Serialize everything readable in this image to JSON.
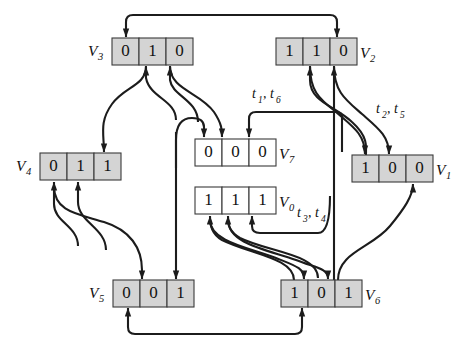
{
  "figure": {
    "type": "state-transition-diagram",
    "background_color": "#ffffff",
    "shaded_cell_color": "#d4d4d4",
    "plain_cell_color": "#ffffff",
    "edge_color": "#1c1c1c"
  },
  "nodes": [
    {
      "id": "v3",
      "label": "V",
      "subscript": "3",
      "bits": [
        "0",
        "1",
        "0"
      ],
      "shaded": true,
      "label_side": "left",
      "box": {
        "x": 112,
        "y": 38,
        "w": 81,
        "h": 27
      }
    },
    {
      "id": "v2",
      "label": "V",
      "subscript": "2",
      "bits": [
        "1",
        "1",
        "0"
      ],
      "shaded": true,
      "label_side": "right",
      "box": {
        "x": 276,
        "y": 38,
        "w": 81,
        "h": 27
      }
    },
    {
      "id": "v7",
      "label": "V",
      "subscript": "7",
      "bits": [
        "0",
        "0",
        "0"
      ],
      "shaded": false,
      "label_side": "right",
      "box": {
        "x": 195,
        "y": 139,
        "w": 81,
        "h": 27
      }
    },
    {
      "id": "v4",
      "label": "V",
      "subscript": "4",
      "bits": [
        "0",
        "1",
        "1"
      ],
      "shaded": true,
      "label_side": "left",
      "box": {
        "x": 40,
        "y": 153,
        "w": 81,
        "h": 27
      }
    },
    {
      "id": "v1",
      "label": "V",
      "subscript": "1",
      "bits": [
        "1",
        "0",
        "0"
      ],
      "shaded": true,
      "label_side": "right",
      "box": {
        "x": 352,
        "y": 155,
        "w": 81,
        "h": 27
      }
    },
    {
      "id": "v0",
      "label": "V",
      "subscript": "0",
      "bits": [
        "1",
        "1",
        "1"
      ],
      "shaded": false,
      "label_side": "right",
      "box": {
        "x": 195,
        "y": 187,
        "w": 81,
        "h": 27
      }
    },
    {
      "id": "v5",
      "label": "V",
      "subscript": "5",
      "bits": [
        "0",
        "0",
        "1"
      ],
      "shaded": true,
      "label_side": "left",
      "box": {
        "x": 113,
        "y": 280,
        "w": 81,
        "h": 27
      }
    },
    {
      "id": "v6",
      "label": "V",
      "subscript": "6",
      "bits": [
        "1",
        "0",
        "1"
      ],
      "shaded": true,
      "label_side": "right",
      "box": {
        "x": 281,
        "y": 280,
        "w": 81,
        "h": 27
      }
    }
  ],
  "transition_labels": [
    {
      "id": "t16",
      "parts": [
        {
          "base": "t",
          "sub": "1"
        },
        {
          "base": "t",
          "sub": "6"
        }
      ],
      "text": "t1, t6",
      "x": 252,
      "y": 95
    },
    {
      "id": "t25",
      "parts": [
        {
          "base": "t",
          "sub": "2"
        },
        {
          "base": "t",
          "sub": "5"
        }
      ],
      "text": "t2, t5",
      "x": 376,
      "y": 110
    },
    {
      "id": "t34",
      "parts": [
        {
          "base": "t",
          "sub": "3"
        },
        {
          "base": "t",
          "sub": "4"
        }
      ],
      "text": "t3, t4",
      "x": 297,
      "y": 214
    }
  ],
  "edges": [
    {
      "id": "e-top-loop",
      "from": "v2",
      "to": "v3",
      "note": "top horizontal loop with two downward arrowheads"
    },
    {
      "id": "e-bottom-loop",
      "from": "v5",
      "to": "v6",
      "note": "bottom horizontal loop with two upward arrowheads"
    },
    {
      "id": "e-v3b2-v4",
      "from": "v3",
      "to": "v4",
      "note": "crossing curve into v4 bit 3"
    },
    {
      "id": "e-v3b3-v7",
      "from": "v3",
      "to": "v7",
      "note": "crossing curve into v7 bit 2"
    },
    {
      "id": "e-v7b1-up",
      "from": "v5",
      "to": "v7",
      "note": "curve up into v7 bit 1"
    },
    {
      "id": "e-v7b3-t16",
      "from": "v1",
      "to": "v7",
      "note": "labeled t1,t6 long horizontal edge into v7 bit 3"
    },
    {
      "id": "e-v2b2",
      "from": "v1",
      "to": "v2",
      "note": "crossing curve into v2 bit 2"
    },
    {
      "id": "e-v2b3",
      "from": "v6",
      "to": "v2",
      "note": "straight vertical edge into v2 bit 3"
    },
    {
      "id": "e-v1b1",
      "from": "v2",
      "to": "v1",
      "note": "crossing curve into v1 bit 1"
    },
    {
      "id": "e-v1b2",
      "from": "v2",
      "to": "v1",
      "note": "crossing curve into v1 bit 2"
    },
    {
      "id": "e-v1b3",
      "from": "v6",
      "to": "v1",
      "note": "curve up from v6 into v1 bit 3"
    },
    {
      "id": "e-v4b1",
      "from": "v5",
      "to": "v4",
      "note": "curve up into v4 bit 1"
    },
    {
      "id": "e-v4b2",
      "from": "v5",
      "to": "v4",
      "note": "curve up into v4 bit 2"
    },
    {
      "id": "e-v5b2",
      "from": "v4",
      "to": "v5",
      "note": "crossing curve down into v5 bit 2"
    },
    {
      "id": "e-v5b3",
      "from": "v7",
      "to": "v5",
      "note": "straight vertical edge down into v5 bit 3"
    },
    {
      "id": "e-v0b1",
      "from": "v6",
      "to": "v0",
      "note": "curve up into v0 bit 1"
    },
    {
      "id": "e-v0b2",
      "from": "v6",
      "to": "v0",
      "note": "curve up into v0 bit 2"
    },
    {
      "id": "e-v0b3-t34",
      "from": "v1",
      "to": "v0",
      "note": "labeled t3,t4 edge into v0 bit 3"
    },
    {
      "id": "e-v6b2",
      "from": "v0",
      "to": "v6",
      "note": "crossing curve down into v6 bit 2"
    },
    {
      "id": "e-v6b3",
      "from": "v0",
      "to": "v6",
      "note": "crossing curve down into v6 bit 3"
    }
  ]
}
